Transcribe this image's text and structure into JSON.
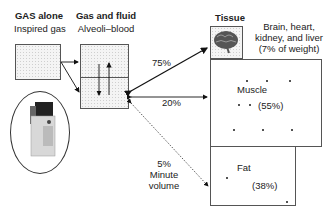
{
  "headers": {
    "gas_alone": {
      "title": "GAS alone",
      "subtitle": "Inspired gas"
    },
    "gas_fluid": {
      "title": "Gas and fluid",
      "subtitle": "Alveoli–blood"
    },
    "tissue": {
      "title": "Tissue"
    }
  },
  "compartments": {
    "vrg": {
      "label_lines": [
        "Brain, heart,",
        "kidney, and liver",
        "(7% of weight)"
      ],
      "icon": "brain-icon"
    },
    "muscle": {
      "name": "Muscle",
      "percent": "(55%)"
    },
    "fat": {
      "name": "Fat",
      "percent": "(38%)"
    }
  },
  "flows": {
    "vrg": "75%",
    "muscle": "20%",
    "fat_lines": [
      "5%",
      "Minute",
      "volume"
    ]
  },
  "vaporizer": {
    "icon": "vaporizer-icon"
  }
}
